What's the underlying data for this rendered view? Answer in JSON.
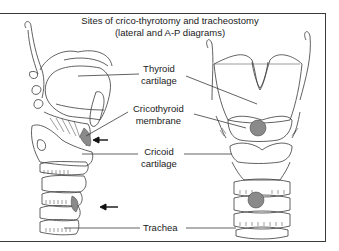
{
  "figure": {
    "title_line1": "Sites of crico-thyrotomy and tracheostomy",
    "title_line2": "(lateral and A-P diagrams)"
  },
  "labels": {
    "thyroid": [
      "Thyroid",
      "cartilage"
    ],
    "cricothyroid": [
      "Cricothyroid",
      "membrane"
    ],
    "cricoid": [
      "Cricoid",
      "cartilage"
    ],
    "trachea": "Trachea"
  },
  "colors": {
    "line": "#3a3a3a",
    "shade": "#8a8a8a",
    "arrow": "#111111"
  },
  "panels": [
    "lateral view",
    "A-P view"
  ]
}
